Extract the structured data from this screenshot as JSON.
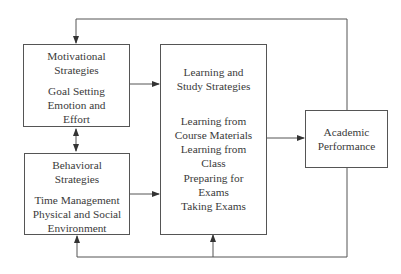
{
  "diagram": {
    "type": "flow-diagram",
    "boxes": {
      "motivational": {
        "title": [
          "Motivational",
          "Strategies"
        ],
        "items": [
          "Goal Setting",
          "Emotion and",
          "Effort"
        ]
      },
      "behavioral": {
        "title": [
          "Behavioral",
          "Strategies"
        ],
        "items": [
          "Time Management",
          "Physical and Social",
          "Environment"
        ]
      },
      "learning": {
        "title": [
          "Learning and",
          "Study Strategies"
        ],
        "items": [
          "Learning from",
          "Course Materials",
          "Learning from",
          "Class",
          "Preparing for",
          "Exams",
          "Taking Exams"
        ]
      },
      "academic": {
        "title": [
          "Academic",
          "Performance"
        ]
      }
    },
    "edges": [
      {
        "from": "motivational",
        "to": "learning",
        "style": "arrow"
      },
      {
        "from": "behavioral",
        "to": "learning",
        "style": "arrow"
      },
      {
        "from": "motivational",
        "to": "behavioral",
        "style": "double-arrow"
      },
      {
        "from": "learning",
        "to": "academic",
        "style": "arrow"
      },
      {
        "from": "academic",
        "to": "motivational",
        "style": "feedback-arrow",
        "route": "top"
      },
      {
        "from": "academic",
        "to": "behavioral",
        "style": "feedback-arrow",
        "route": "bottom"
      },
      {
        "from": "academic",
        "to": "learning",
        "style": "feedback-arrow",
        "route": "bottom"
      }
    ],
    "colors": {
      "line": "#555555",
      "text": "#3a3a3a",
      "background": "#ffffff"
    }
  }
}
